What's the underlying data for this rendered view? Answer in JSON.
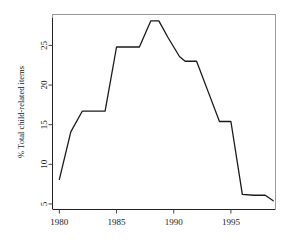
{
  "chart_data": {
    "type": "line",
    "title": "",
    "subtitle": "",
    "xlabel": "",
    "ylabel": "% Total child-related items",
    "xlim": [
      1979.4,
      1998.9
    ],
    "ylim": [
      4.3,
      28.9
    ],
    "xticks": [
      1980,
      1985,
      1990,
      1995
    ],
    "xtick_labels": [
      "1980",
      "1985",
      "1990",
      "1995"
    ],
    "yticks": [
      5,
      10,
      15,
      20,
      25
    ],
    "ytick_labels": [
      "5",
      "10",
      "15",
      "20",
      "25"
    ],
    "grid": false,
    "legend": false,
    "legend_position": "none",
    "line_color": "#1a1a1a",
    "frame_color": "#9a9a9a",
    "axis_color": "#222222",
    "series": [
      {
        "name": "% Total child-related items",
        "x": [
          1980,
          1981,
          1982,
          1983,
          1984,
          1985,
          1986,
          1987,
          1988,
          1988.7,
          1989.5,
          1990.5,
          1991,
          1992,
          1993,
          1994,
          1995,
          1996,
          1997,
          1998,
          1998.7
        ],
        "values": [
          8.1,
          14.1,
          16.7,
          16.7,
          16.7,
          24.8,
          24.8,
          24.8,
          28.1,
          28.1,
          26.0,
          23.6,
          23.0,
          23.0,
          19.2,
          15.4,
          15.4,
          6.2,
          6.1,
          6.1,
          5.4
        ]
      }
    ]
  },
  "axes": {
    "y_axis_title": "% Total child-related items",
    "x_axis_title": ""
  }
}
